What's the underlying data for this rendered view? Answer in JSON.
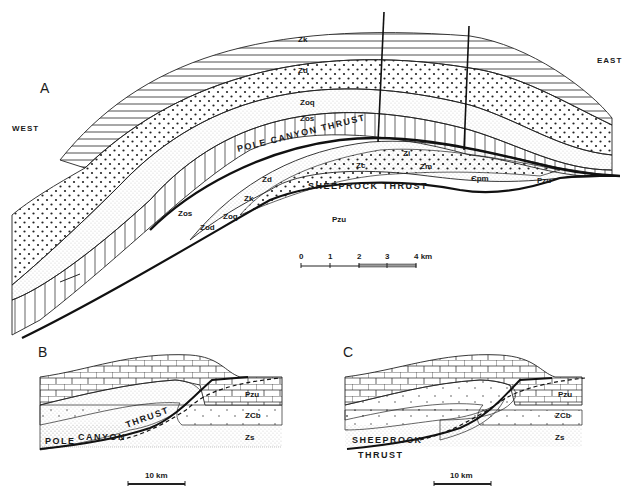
{
  "panel_a": {
    "label": "A",
    "west_label": "WEST",
    "east_label": "EAST",
    "units": {
      "zk_top": "Zk",
      "zd_top": "Zd",
      "zoq_top": "Zoq",
      "zos_top": "Zos",
      "zc": "Zc",
      "zi": "Zi",
      "zm": "Zm",
      "cpm": "Єpm",
      "pzu_small": "Pzu",
      "zd_lower": "Zd",
      "zk_lower": "Zk",
      "zos_lower": "Zos",
      "zod": "Zod",
      "zoq_lower": "Zoq",
      "pzu": "Pzu"
    },
    "thrusts": {
      "pole_canyon": "POLE CANYON THRUST",
      "sheeprock": "SHEEPROCK THRUST"
    },
    "scale_bar": {
      "ticks": [
        "0",
        "1",
        "2",
        "3",
        "4 km"
      ]
    }
  },
  "panel_b": {
    "label": "B",
    "units": {
      "pzu": "Pzu",
      "zcb": "ZCb",
      "zs": "Zs"
    },
    "thrust_label": "POLE CANYON THRUST",
    "thrust_words": [
      "POLE",
      "CANYON",
      "THRUST"
    ],
    "scale_bar": "10 km"
  },
  "panel_c": {
    "label": "C",
    "units": {
      "pzu": "Pzu",
      "zcb": "ZCb",
      "zs": "Zs"
    },
    "thrust_words": [
      "SHEEPROCK",
      "THRUST"
    ],
    "scale_bar": "10 km"
  },
  "colors": {
    "ink": "#1a1a1a",
    "paper": "#ffffff"
  }
}
